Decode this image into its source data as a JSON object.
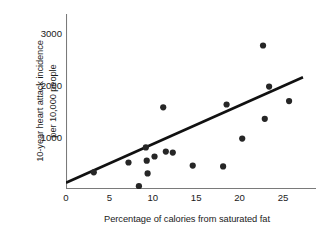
{
  "chart_data": {
    "type": "scatter",
    "title": "",
    "xlabel": "Percentage of calories from saturated fat",
    "ylabel": "10-year heart attack incidence\nper 10,000 people",
    "xlim": [
      0,
      27.5
    ],
    "ylim": [
      0,
      3300
    ],
    "xticks": [
      0,
      5,
      10,
      15,
      20,
      25
    ],
    "xtick_labels": [
      "0",
      "5",
      "10",
      "15",
      "20",
      "25"
    ],
    "yticks": [
      1000,
      2000,
      3000
    ],
    "ytick_labels": [
      "1000",
      "2000",
      "3000"
    ],
    "grid": false,
    "legend": null,
    "marker": {
      "shape": "circle",
      "color": "#262626",
      "size": 4.4
    },
    "points": [
      {
        "x": 3.2,
        "y": 320
      },
      {
        "x": 7.2,
        "y": 510
      },
      {
        "x": 8.4,
        "y": 55
      },
      {
        "x": 9.2,
        "y": 800
      },
      {
        "x": 9.3,
        "y": 545
      },
      {
        "x": 9.4,
        "y": 300
      },
      {
        "x": 10.2,
        "y": 625
      },
      {
        "x": 11.2,
        "y": 1570
      },
      {
        "x": 11.5,
        "y": 720
      },
      {
        "x": 12.3,
        "y": 700
      },
      {
        "x": 14.6,
        "y": 450
      },
      {
        "x": 18.1,
        "y": 435
      },
      {
        "x": 18.5,
        "y": 1625
      },
      {
        "x": 20.3,
        "y": 970
      },
      {
        "x": 22.7,
        "y": 2760
      },
      {
        "x": 22.9,
        "y": 1350
      },
      {
        "x": 23.4,
        "y": 1970
      },
      {
        "x": 25.7,
        "y": 1690
      }
    ],
    "trendline": {
      "type": "linear-fit",
      "color": "#111111",
      "width": 2.6,
      "x_start": 0.0,
      "y_start": 120,
      "x_end": 27.3,
      "y_end": 2150
    },
    "axis": {
      "color": "#7a7a7a",
      "width": 1.1,
      "tick_length": 5
    }
  }
}
